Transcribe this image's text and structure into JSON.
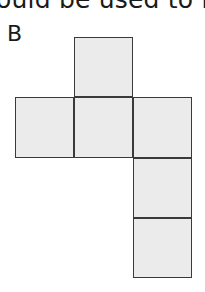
{
  "question": {
    "cropped_text": "ould be used to m"
  },
  "option": {
    "label": "B",
    "fill_color": "#ebebeb",
    "stroke_color": "#3a3a3a",
    "net_squares": [
      {
        "name": "top",
        "col": 1,
        "row": 0
      },
      {
        "name": "middle-left",
        "col": 0,
        "row": 1
      },
      {
        "name": "middle-center",
        "col": 1,
        "row": 1
      },
      {
        "name": "middle-right",
        "col": 2,
        "row": 1
      },
      {
        "name": "lower-right-1",
        "col": 2,
        "row": 2
      },
      {
        "name": "lower-right-2",
        "col": 2,
        "row": 3
      }
    ]
  }
}
